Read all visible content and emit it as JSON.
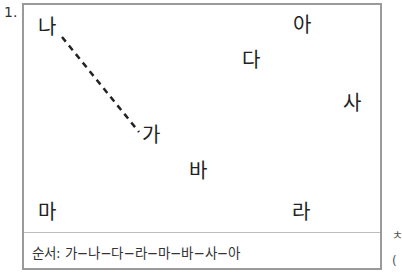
{
  "problem_number": "1.",
  "labels": [
    {
      "id": "na",
      "text": "나",
      "x": 14,
      "y": 12
    },
    {
      "id": "a",
      "text": "아",
      "x": 269,
      "y": 10
    },
    {
      "id": "da",
      "text": "다",
      "x": 218,
      "y": 45
    },
    {
      "id": "sa",
      "text": "사",
      "x": 319,
      "y": 88
    },
    {
      "id": "ga",
      "text": "가",
      "x": 118,
      "y": 120
    },
    {
      "id": "ba",
      "text": "바",
      "x": 165,
      "y": 156
    },
    {
      "id": "ma",
      "text": "마",
      "x": 14,
      "y": 197
    },
    {
      "id": "ra",
      "text": "라",
      "x": 268,
      "y": 197
    }
  ],
  "dashed_line": {
    "from": "na",
    "to": "ga",
    "x1": 38,
    "y1": 32,
    "x2": 115,
    "y2": 127
  },
  "order_text": "순서: 가−나−다−라−마−바−사−아",
  "cutoff_text": [
    "ㅊ",
    "("
  ]
}
